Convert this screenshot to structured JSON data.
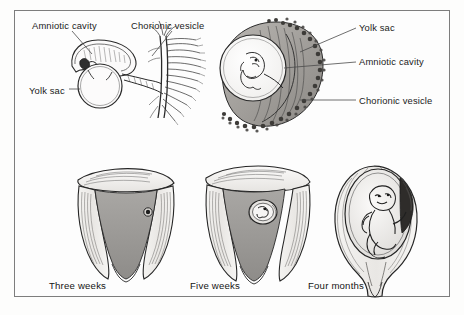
{
  "figure": {
    "frame_color": "#7d7d7d",
    "background_color": "#fdfdfd",
    "ink_color": "#1b1b1b"
  },
  "top_left_diagram": {
    "name": "early-embryo-with-chorionic-villi",
    "labels": {
      "amniotic_cavity": "Amniotic cavity",
      "chorionic_vesicle": "Chorionic vesicle",
      "yolk_sac": "Yolk sac"
    }
  },
  "top_right_diagram": {
    "name": "embryo-in-chorionic-vesicle",
    "labels": {
      "yolk_sac": "Yolk sac",
      "amniotic_cavity": "Amniotic cavity",
      "chorionic_vesicle": "Chorionic vesicle"
    }
  },
  "bottom_row": {
    "items": [
      {
        "caption": "Three weeks",
        "name": "uterus-three-weeks"
      },
      {
        "caption": "Five weeks",
        "name": "uterus-five-weeks"
      },
      {
        "caption": "Four months",
        "name": "uterus-four-months"
      }
    ]
  }
}
